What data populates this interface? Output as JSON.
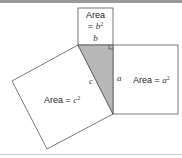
{
  "diagram": {
    "colors": {
      "stroke": "#555555",
      "triangle_fill": "#b8b8b8",
      "background": "#ffffff",
      "frame": "#9a9a9a"
    },
    "square_b": {
      "label_line1": "Area",
      "label_eq": "= ",
      "label_var": "b",
      "label_exp": "2",
      "side_label": "b"
    },
    "square_a": {
      "label_text": "Area = ",
      "label_var": "a",
      "label_exp": "2",
      "side_label": "a"
    },
    "square_c": {
      "label_text": "Area = ",
      "label_var": "c",
      "label_exp": "2",
      "side_label": "c"
    }
  }
}
